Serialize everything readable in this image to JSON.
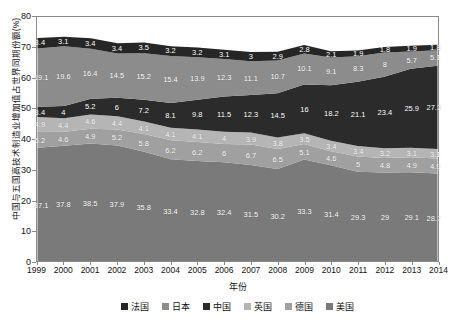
{
  "chart_data": {
    "type": "area",
    "stacked": true,
    "title": "",
    "xlabel": "年份",
    "ylabel": "中国与五国高技术制造业增加值占世界同期份额(%)",
    "ylim": [
      0,
      80
    ],
    "yticks": [
      0,
      10,
      20,
      30,
      40,
      50,
      60,
      70,
      80
    ],
    "grid": false,
    "legend_position": "bottom",
    "categories": [
      "1999",
      "2000",
      "2001",
      "2002",
      "2003",
      "2004",
      "2005",
      "2006",
      "2007",
      "2008",
      "2009",
      "2010",
      "2011",
      "2012",
      "2013",
      "2014"
    ],
    "stack_order_bottom_to_top": [
      "美国",
      "德国",
      "英国",
      "中国",
      "日本",
      "法国"
    ],
    "series": [
      {
        "name": "法国",
        "color": "#262626",
        "values": [
          3.4,
          3.1,
          3.4,
          3.4,
          3.5,
          3.2,
          3.2,
          3.1,
          3,
          2.9,
          2.8,
          2.1,
          1.9,
          1.8,
          1.9,
          1.8
        ]
      },
      {
        "name": "日本",
        "color": "#8c8c8c",
        "values": [
          19.1,
          19.6,
          16.4,
          14.5,
          15.2,
          15.4,
          13.9,
          12.3,
          11.1,
          10.7,
          10.1,
          9.1,
          8.3,
          8,
          5.7,
          5.1
        ]
      },
      {
        "name": "中国",
        "color": "#2b2b2b",
        "values": [
          3.4,
          4,
          5.2,
          6,
          7.2,
          8.1,
          9.8,
          11.5,
          12.3,
          14.5,
          16,
          18.2,
          21.1,
          23.4,
          25.9,
          27.3
        ]
      },
      {
        "name": "英国",
        "color": "#b5b5b5",
        "values": [
          4.9,
          4.4,
          4.6,
          4.4,
          4.1,
          4.1,
          4.1,
          4,
          3.9,
          3.8,
          3.5,
          3.4,
          3.4,
          3.2,
          3.1,
          3.1
        ]
      },
      {
        "name": "德国",
        "color": "#a0a0a0",
        "values": [
          5.2,
          4.6,
          4.9,
          5.2,
          5.8,
          6.2,
          6.2,
          6,
          6.7,
          6.5,
          5.1,
          4.6,
          5,
          4.8,
          4.9,
          4.9
        ]
      },
      {
        "name": "美国",
        "color": "#7a7a7a",
        "values": [
          37.1,
          37.8,
          38.5,
          37.9,
          35.8,
          33.4,
          32.8,
          32.4,
          31.5,
          30.2,
          33.3,
          31.4,
          29.3,
          29,
          29.1,
          28.7
        ]
      }
    ]
  },
  "legend": {
    "items": [
      {
        "label": "法国",
        "color": "#262626"
      },
      {
        "label": "日本",
        "color": "#8c8c8c"
      },
      {
        "label": "中国",
        "color": "#2b2b2b"
      },
      {
        "label": "英国",
        "color": "#b5b5b5"
      },
      {
        "label": "德国",
        "color": "#a0a0a0"
      },
      {
        "label": "美国",
        "color": "#7a7a7a"
      }
    ]
  }
}
